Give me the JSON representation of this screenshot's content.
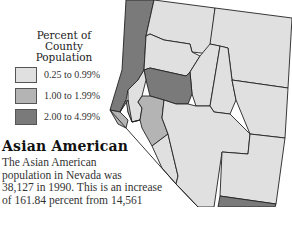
{
  "legend": {
    "title_line1": "Percent of",
    "title_line2": "County Population",
    "items": [
      {
        "label": "0.25 to 0.99%",
        "color": "#e0e0e0"
      },
      {
        "label": "1.00 to 1.99%",
        "color": "#b4b4b4"
      },
      {
        "label": "2.00 to 4.99%",
        "color": "#7a7a7a"
      }
    ]
  },
  "title": "Asian American",
  "body": {
    "line1": "The Asian American",
    "line2": "population in Nevada was",
    "line3": "38,127 in 1990. This is an increase",
    "line4": "of 161.84 percent from 14,561",
    "line5": "in 1980. Most of the county"
  },
  "colors": {
    "low": "#e0e0e0",
    "mid": "#b4b4b4",
    "high": "#7a7a7a",
    "border": "#222222"
  }
}
